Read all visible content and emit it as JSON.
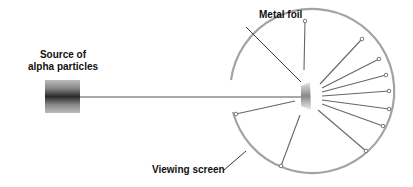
{
  "labels": {
    "source_line1": "Source of",
    "source_line2": "alpha particles",
    "metal_foil": "Metal foil",
    "viewing_screen": "Viewing screen"
  },
  "colors": {
    "screen": "#a0a0a0",
    "beam": "#555555",
    "text": "#111111"
  }
}
